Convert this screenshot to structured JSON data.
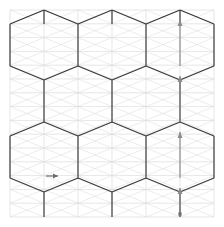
{
  "figure": {
    "type": "diagram",
    "width": 224,
    "height": 227,
    "background_color": "#ffffff"
  },
  "colors": {
    "background": "#ffffff",
    "grid_light": "#d6d6d6",
    "grid_diagonal": "#dcdcdc",
    "hexagon_stroke": "#3a3a3a",
    "vertical_member": "#4a4a4a",
    "arrow_color": "#8c8c8c",
    "marker_color": "#6e6e6e"
  },
  "geometry": {
    "plot_left": 10,
    "plot_top": 10,
    "plot_right": 214,
    "plot_bottom": 217,
    "cell_width": 34,
    "cell_height": 13.8,
    "hex_half_width": 34,
    "hex_top_cap_height": 14,
    "hex_body_height": 42,
    "row_pitch": 56,
    "row_tops": [
      10,
      66,
      122,
      178
    ],
    "column_xs": [
      10,
      44,
      78,
      112,
      146,
      180,
      214
    ],
    "grid_rows_y": [
      10,
      23.8,
      37.6,
      51.4,
      65.2,
      79,
      92.8,
      106.6,
      120.4,
      134.2,
      148,
      161.8,
      175.6,
      189.4,
      203.2,
      217
    ]
  },
  "grid": {
    "horizontal_line_count": 16,
    "vertical_line_count": 7,
    "diagonals": "x-cross-per-cell",
    "line_width_light": 0.7,
    "line_width_hex": 1.3
  },
  "hexagons": {
    "rows": 4,
    "per_row": 3,
    "stagger": "alternating",
    "description": "dark hexagon outlines tiling the light triangular grid"
  },
  "annotations": {
    "vertical_arrows": {
      "count": 4,
      "x": 180,
      "direction": "up",
      "segments": [
        {
          "y_start": 66,
          "y_end": 20,
          "label": ""
        },
        {
          "y_start": 122,
          "y_end": 76,
          "label": ""
        },
        {
          "y_start": 178,
          "y_end": 132,
          "label": ""
        },
        {
          "y_start": 214,
          "y_end": 188,
          "label": ""
        }
      ],
      "head_length": 6,
      "head_width": 5
    },
    "horizontal_marker": {
      "x_start": 46,
      "x_end": 58,
      "y": 176,
      "direction": "right",
      "label": ""
    },
    "end_dot": {
      "x": 180,
      "y": 214,
      "size": 3.2
    }
  },
  "labels": {
    "axis_x": "",
    "axis_y": "",
    "caption": ""
  }
}
